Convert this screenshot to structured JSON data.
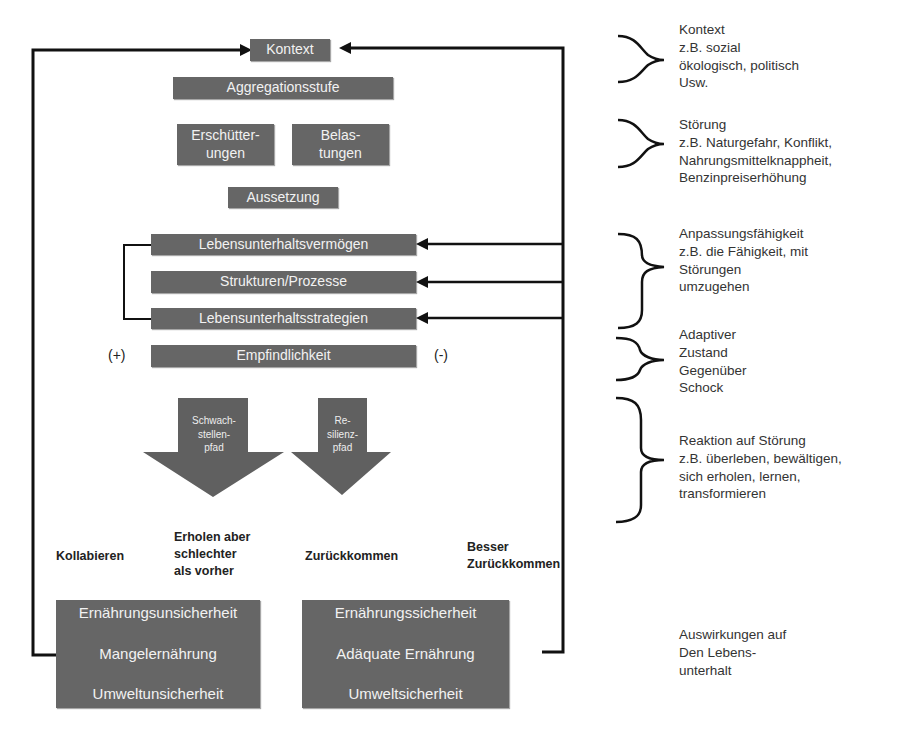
{
  "diagram": {
    "top": {
      "context": "Kontext",
      "aggregation": "Aggregationsstufe",
      "shocks": [
        "Erschütter-",
        "ungen"
      ],
      "stresses": [
        "Belas-",
        "tungen"
      ],
      "exposure": "Aussetzung"
    },
    "middle": {
      "assets": "Lebensunterhaltsvermögen",
      "structures": "Strukturen/Prozesse",
      "strategies": "Lebensunterhaltsstrategien",
      "sensitivity": "Empfindlichkeit",
      "plus": "(+)",
      "minus": "(-)"
    },
    "pathways": {
      "vulnerability": [
        "Schwach-",
        "stellen-",
        "pfad"
      ],
      "resilience": [
        "Re-",
        "silienz-",
        "pfad"
      ]
    },
    "outcomes": {
      "collapse": "Kollabieren",
      "recover_worse": [
        "Erholen aber",
        "schlechter",
        "als vorher"
      ],
      "bounce_back": "Zurückkommen",
      "bounce_better": [
        "Besser",
        "Zurückkommen"
      ]
    },
    "results": {
      "negative": [
        "Ernährungsunsicherheit",
        "Mangelernährung",
        "Umweltunsicherheit"
      ],
      "positive": [
        "Ernährungssicherheit",
        "Adäquate Ernährung",
        "Umweltsicherheit"
      ]
    }
  },
  "annotations": {
    "context": [
      "Kontext",
      "z.B. sozial",
      "ökologisch, politisch",
      "Usw."
    ],
    "disturbance": [
      "Störung",
      "z.B. Naturgefahr, Konflikt,",
      "Nahrungsmittelknappheit,",
      "Benzinpreiserhöhung"
    ],
    "adaptive_capacity": [
      "Anpassungsfähigkeit",
      "z.B. die Fähigkeit, mit",
      "Störungen",
      "umzugehen"
    ],
    "adaptive_state": [
      "Adaptiver",
      "Zustand",
      "Gegenüber",
      "Schock"
    ],
    "reaction": [
      "Reaktion auf Störung",
      "z.B. überleben, bewältigen,",
      "sich erholen, lernen,",
      "transformieren"
    ],
    "impacts": [
      "Auswirkungen auf",
      "Den Lebens-",
      "unterhalt"
    ]
  },
  "colors": {
    "box": "#666666",
    "line": "#111111",
    "text_light": "#f2f2f2"
  }
}
